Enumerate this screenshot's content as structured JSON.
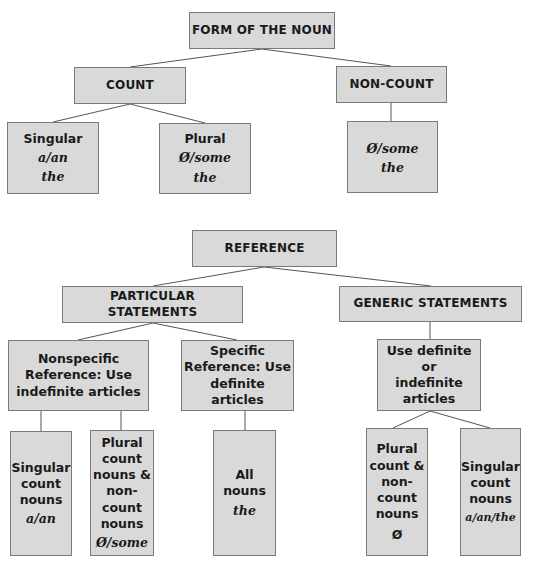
{
  "form_tree": {
    "root": "FORM OF THE NOUN",
    "count": {
      "label": "COUNT",
      "singular": {
        "title": "Singular",
        "articles": [
          "a/an",
          "the"
        ]
      },
      "plural": {
        "title": "Plural",
        "articles": [
          "Ø/some",
          "the"
        ]
      }
    },
    "noncount": {
      "label": "NON-COUNT",
      "articles": [
        "Ø/some",
        "the"
      ]
    }
  },
  "reference_tree": {
    "root": "REFERENCE",
    "particular": {
      "label": "PARTICULAR STATEMENTS",
      "nonspecific": {
        "lines": [
          "Nonspecific",
          "Reference: Use",
          "indefinite articles"
        ],
        "singular": {
          "lines": [
            "Singular",
            "count",
            "nouns"
          ],
          "article": "a/an"
        },
        "plural": {
          "lines": [
            "Plural",
            "count",
            "nouns &",
            "non-count",
            "nouns"
          ],
          "article": "Ø/some"
        }
      },
      "specific": {
        "lines": [
          "Specific",
          "Reference: Use",
          "definite articles"
        ],
        "all": {
          "lines": [
            "All nouns"
          ],
          "article": "the"
        }
      }
    },
    "generic": {
      "label": "GENERIC STATEMENTS",
      "use": {
        "lines": [
          "Use definite or",
          "indefinite",
          "articles"
        ]
      },
      "plural": {
        "lines": [
          "Plural",
          "count &",
          "non-",
          "count",
          "nouns"
        ],
        "article": "Ø"
      },
      "singular": {
        "lines": [
          "Singular",
          "count",
          "nouns"
        ],
        "article": "a/an/the"
      }
    }
  },
  "colors": {
    "box_fill": "#d9d9d9",
    "box_border": "#7a7a7a",
    "connector": "#555555"
  }
}
